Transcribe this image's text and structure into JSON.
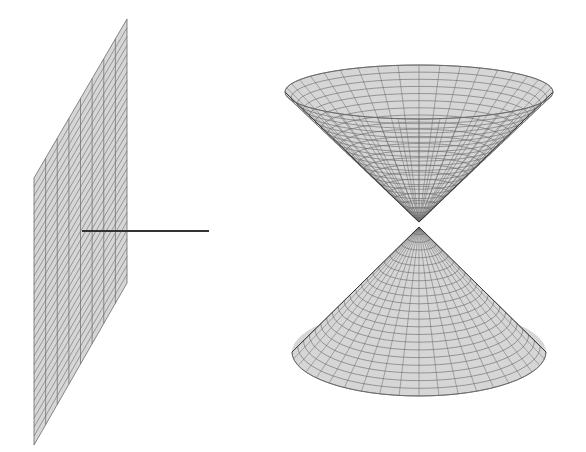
{
  "figure": {
    "colors": {
      "fill": "#d6d6d6",
      "mesh": "#6a6a6a",
      "line": "#333333",
      "background": "#ffffff"
    },
    "plane": {
      "corners": [
        [
          127,
          19
        ],
        [
          127,
          283
        ],
        [
          34,
          445
        ],
        [
          34,
          178
        ]
      ],
      "vertical_lines": 8,
      "diagonal_lines": 30
    },
    "normal_line": {
      "x1": 82,
      "y1": 231,
      "x2": 209,
      "y2": 231
    },
    "cone": {
      "cx": 419,
      "upper": {
        "rim_cy": 92,
        "rx": 134,
        "ry": 27,
        "apex_y": 222
      },
      "lower": {
        "base_cy": 352,
        "rx": 127,
        "ry": 44,
        "apex_y": 227
      },
      "radial_lines": 40,
      "rings": 22
    }
  }
}
